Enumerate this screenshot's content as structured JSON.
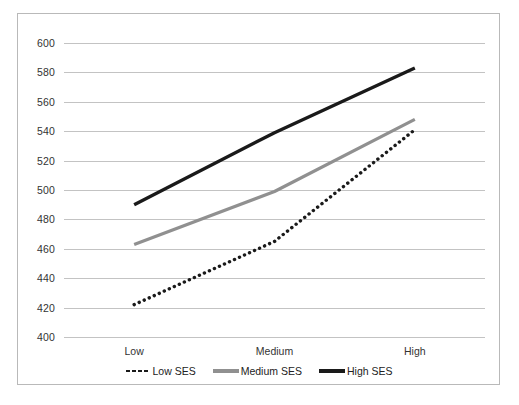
{
  "chart_data": {
    "type": "line",
    "title": "",
    "xlabel": "",
    "ylabel": "",
    "categories": [
      "Low",
      "Medium",
      "High"
    ],
    "ylim": [
      400,
      600
    ],
    "yticks": [
      400,
      420,
      440,
      460,
      480,
      500,
      520,
      540,
      560,
      580,
      600
    ],
    "ytick_labels": [
      "400",
      "420",
      "440",
      "460",
      "480",
      "500",
      "520",
      "540",
      "560",
      "580",
      "600"
    ],
    "grid": true,
    "legend_position": "bottom",
    "series": [
      {
        "name": "Low SES",
        "style": "dotted",
        "color": "#1a1a1a",
        "values": [
          422,
          465,
          541
        ]
      },
      {
        "name": "Medium SES",
        "style": "solid",
        "color": "#909090",
        "values": [
          463,
          499,
          548
        ]
      },
      {
        "name": "High SES",
        "style": "solid",
        "color": "#1a1a1a",
        "values": [
          490,
          539,
          583
        ]
      }
    ]
  },
  "legend": {
    "entries": [
      {
        "label": "Low SES",
        "marker": "dotted-line-marker"
      },
      {
        "label": "Medium SES",
        "marker": "gray-line-marker"
      },
      {
        "label": "High SES",
        "marker": "black-line-marker"
      }
    ]
  },
  "colors": {
    "gridline": "#c3c3c3",
    "border": "#b9b9b9",
    "text": "#333333",
    "low_ses": "#1a1a1a",
    "medium_ses": "#909090",
    "high_ses": "#1a1a1a"
  }
}
